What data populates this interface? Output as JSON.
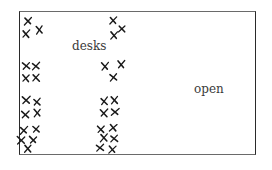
{
  "diagram": {
    "type": "floor-plan-sketch",
    "labels": {
      "desks": "desks",
      "open": "open"
    },
    "label_positions": {
      "desks": {
        "x": 72,
        "y": 43
      },
      "open": {
        "x": 194,
        "y": 85
      }
    },
    "room": {
      "x": 19,
      "y": 11,
      "width": 237,
      "height": 144
    },
    "marker_symbol": "x",
    "colors": {
      "ink": "#1a1a1a",
      "text": "#3a3a3a",
      "border": "#2a2a2a",
      "background": "#ffffff"
    },
    "desk_columns": [
      {
        "name": "left-column",
        "groups": [
          {
            "marks": [
              {
                "x": 28,
                "y": 21
              },
              {
                "x": 26,
                "y": 34
              },
              {
                "x": 39,
                "y": 30
              }
            ]
          },
          {
            "marks": [
              {
                "x": 26,
                "y": 66
              },
              {
                "x": 36,
                "y": 66
              },
              {
                "x": 26,
                "y": 78
              },
              {
                "x": 36,
                "y": 78
              }
            ]
          },
          {
            "marks": [
              {
                "x": 26,
                "y": 100
              },
              {
                "x": 37,
                "y": 102
              },
              {
                "x": 25,
                "y": 114
              },
              {
                "x": 37,
                "y": 113
              }
            ]
          },
          {
            "marks": [
              {
                "x": 24,
                "y": 130
              },
              {
                "x": 36,
                "y": 129
              },
              {
                "x": 21,
                "y": 140
              },
              {
                "x": 33,
                "y": 140
              },
              {
                "x": 28,
                "y": 149
              }
            ]
          }
        ]
      },
      {
        "name": "right-column",
        "groups": [
          {
            "marks": [
              {
                "x": 113,
                "y": 21
              },
              {
                "x": 114,
                "y": 35
              },
              {
                "x": 122,
                "y": 29
              }
            ]
          },
          {
            "marks": [
              {
                "x": 105,
                "y": 66
              },
              {
                "x": 121,
                "y": 64
              },
              {
                "x": 113,
                "y": 77
              }
            ]
          },
          {
            "marks": [
              {
                "x": 104,
                "y": 101
              },
              {
                "x": 114,
                "y": 100
              },
              {
                "x": 104,
                "y": 113
              },
              {
                "x": 115,
                "y": 112
              }
            ]
          },
          {
            "marks": [
              {
                "x": 101,
                "y": 129
              },
              {
                "x": 113,
                "y": 128
              },
              {
                "x": 104,
                "y": 138
              },
              {
                "x": 114,
                "y": 139
              },
              {
                "x": 100,
                "y": 148
              },
              {
                "x": 112,
                "y": 149
              }
            ]
          }
        ]
      }
    ]
  }
}
